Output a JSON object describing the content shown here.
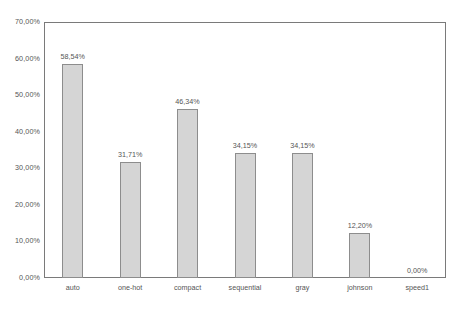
{
  "chart_data": {
    "type": "bar",
    "title": "",
    "xlabel": "",
    "ylabel": "",
    "categories": [
      "auto",
      "one-hot",
      "compact",
      "sequential",
      "gray",
      "johnson",
      "speed1"
    ],
    "values": [
      58.54,
      31.71,
      46.34,
      34.15,
      34.15,
      12.2,
      0.0
    ],
    "value_labels": [
      "58,54%",
      "31,71%",
      "46,34%",
      "34,15%",
      "34,15%",
      "12,20%",
      "0,00%"
    ],
    "ylim": [
      0,
      70
    ],
    "ytick_values": [
      0,
      10,
      20,
      30,
      40,
      50,
      60,
      70
    ],
    "ytick_labels": [
      "0,00%",
      "10,00%",
      "20,00%",
      "30,00%",
      "40,00%",
      "50,00%",
      "60,00%",
      "70,00%"
    ],
    "grid": false,
    "legend": null,
    "bar_color": "#d5d5d5",
    "bar_edge_color": "#8d8d8d",
    "frame_color": "#7a7a7a",
    "background": "#ffffff"
  }
}
